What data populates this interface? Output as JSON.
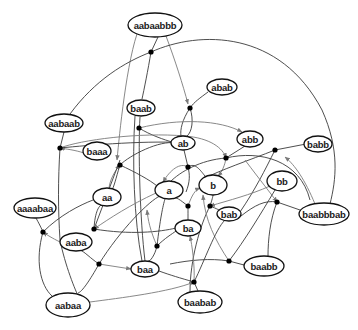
{
  "diagram": {
    "type": "hypergraph",
    "nodes": [
      {
        "id": "aabaabbb",
        "label": "aabaabbb",
        "cx": 155,
        "cy": 25,
        "rx": 27,
        "ry": 12
      },
      {
        "id": "abab",
        "label": "abab",
        "cx": 222,
        "cy": 87,
        "rx": 15,
        "ry": 8
      },
      {
        "id": "baab",
        "label": "baab",
        "cx": 141,
        "cy": 108,
        "rx": 14,
        "ry": 8
      },
      {
        "id": "aabaab",
        "label": "aabaab",
        "cx": 64,
        "cy": 123,
        "rx": 19,
        "ry": 9
      },
      {
        "id": "ab",
        "label": "ab",
        "cx": 183,
        "cy": 143,
        "rx": 12,
        "ry": 7
      },
      {
        "id": "abb",
        "label": "abb",
        "cx": 250,
        "cy": 139,
        "rx": 13,
        "ry": 8
      },
      {
        "id": "babb",
        "label": "babb",
        "cx": 318,
        "cy": 144,
        "rx": 14,
        "ry": 8
      },
      {
        "id": "baaa",
        "label": "baaa",
        "cx": 97,
        "cy": 151,
        "rx": 14,
        "ry": 9
      },
      {
        "id": "a",
        "label": "a",
        "cx": 169,
        "cy": 190,
        "rx": 14,
        "ry": 9
      },
      {
        "id": "b",
        "label": "b",
        "cx": 213,
        "cy": 185,
        "rx": 14,
        "ry": 10
      },
      {
        "id": "bb",
        "label": "bb",
        "cx": 282,
        "cy": 181,
        "rx": 15,
        "ry": 10
      },
      {
        "id": "aa",
        "label": "aa",
        "cx": 107,
        "cy": 197,
        "rx": 14,
        "ry": 9
      },
      {
        "id": "aaaabaa",
        "label": "aaaabaa",
        "cx": 35,
        "cy": 208,
        "rx": 21,
        "ry": 10
      },
      {
        "id": "ba",
        "label": "ba",
        "cx": 188,
        "cy": 228,
        "rx": 13,
        "ry": 8
      },
      {
        "id": "bab",
        "label": "bab",
        "cx": 229,
        "cy": 214,
        "rx": 12,
        "ry": 7
      },
      {
        "id": "baabbbab",
        "label": "baabbbab",
        "cx": 324,
        "cy": 214,
        "rx": 25,
        "ry": 11
      },
      {
        "id": "aaba",
        "label": "aaba",
        "cx": 76,
        "cy": 242,
        "rx": 16,
        "ry": 9
      },
      {
        "id": "baa",
        "label": "baa",
        "cx": 145,
        "cy": 269,
        "rx": 14,
        "ry": 8
      },
      {
        "id": "baabb",
        "label": "baabb",
        "cx": 264,
        "cy": 266,
        "rx": 20,
        "ry": 10
      },
      {
        "id": "aabaa",
        "label": "aabaa",
        "cx": 68,
        "cy": 305,
        "rx": 22,
        "ry": 12
      },
      {
        "id": "baabab",
        "label": "baabab",
        "cx": 200,
        "cy": 302,
        "rx": 22,
        "ry": 11
      }
    ],
    "junctions": [
      {
        "id": "j1",
        "x": 151,
        "y": 52
      },
      {
        "id": "j2",
        "x": 190,
        "y": 108
      },
      {
        "id": "j3",
        "x": 139,
        "y": 128
      },
      {
        "id": "j4",
        "x": 60,
        "y": 148
      },
      {
        "id": "j5",
        "x": 120,
        "y": 165
      },
      {
        "id": "j6",
        "x": 226,
        "y": 158
      },
      {
        "id": "j7",
        "x": 275,
        "y": 150
      },
      {
        "id": "j8",
        "x": 188,
        "y": 167
      },
      {
        "id": "j9",
        "x": 94,
        "y": 229
      },
      {
        "id": "j10",
        "x": 43,
        "y": 232
      },
      {
        "id": "j11",
        "x": 188,
        "y": 206
      },
      {
        "id": "j12",
        "x": 210,
        "y": 206
      },
      {
        "id": "j13",
        "x": 277,
        "y": 202
      },
      {
        "id": "j14",
        "x": 99,
        "y": 264
      },
      {
        "id": "j15",
        "x": 157,
        "y": 246
      },
      {
        "id": "j16",
        "x": 229,
        "y": 261
      },
      {
        "id": "j17",
        "x": 194,
        "y": 282
      }
    ],
    "edges": [
      {
        "d": "M137,34 C125,70 118,150 117,160",
        "arrow": true
      },
      {
        "d": "M158,37 L151,52 C148,70 144,90 142,99",
        "arrow": false
      },
      {
        "d": "M166,36 C175,60 183,85 188,104",
        "arrow": true
      },
      {
        "d": "M70,114 C95,80 125,62 151,52 C200,30 280,30 322,110 C340,150 336,180 330,204",
        "arrow": false
      },
      {
        "d": "M208,92 C200,98 194,102 190,108",
        "arrow": false
      },
      {
        "d": "M190,108 C182,120 180,130 181,136",
        "arrow": false
      },
      {
        "d": "M190,108 C194,120 192,132 187,136",
        "arrow": false
      },
      {
        "d": "M139,128 C150,135 165,140 172,142",
        "arrow": false
      },
      {
        "d": "M139,128 C180,118 220,120 242,132",
        "arrow": true
      },
      {
        "d": "M140,117 C138,150 140,220 145,261",
        "arrow": false
      },
      {
        "d": "M135,116 C132,160 134,220 142,261",
        "arrow": false
      },
      {
        "d": "M60,148 C80,140 140,132 185,136 C210,138 223,148 226,158",
        "arrow": true
      },
      {
        "d": "M84,153 C75,150 66,149 60,148",
        "arrow": true
      },
      {
        "d": "M64,132 L60,148 C58,180 58,210 60,240 C65,265 75,290 80,300",
        "arrow": false
      },
      {
        "d": "M60,148 C90,145 150,140 190,143",
        "arrow": false
      },
      {
        "d": "M120,165 C135,172 150,180 157,186",
        "arrow": false
      },
      {
        "d": "M109,188 C110,180 114,172 120,165",
        "arrow": true
      },
      {
        "d": "M120,165 C130,155 160,140 175,143",
        "arrow": false
      },
      {
        "d": "M226,158 L245,146",
        "arrow": false
      },
      {
        "d": "M226,158 C225,165 222,172 218,176",
        "arrow": true
      },
      {
        "d": "M226,158 C260,150 300,160 310,200",
        "arrow": false
      },
      {
        "d": "M226,158 C200,160 180,172 170,182",
        "arrow": false
      },
      {
        "d": "M275,150 L306,144",
        "arrow": false
      },
      {
        "d": "M275,150 C265,170 255,190 240,212",
        "arrow": false
      },
      {
        "d": "M275,150 C250,160 220,170 201,180",
        "arrow": false
      },
      {
        "d": "M315,204 C305,180 295,165 285,157",
        "arrow": true
      },
      {
        "d": "M188,167 C190,175 190,182 186,192",
        "arrow": false
      },
      {
        "d": "M188,167 C180,162 170,170 163,182",
        "arrow": true
      },
      {
        "d": "M188,167 C195,162 200,170 205,176",
        "arrow": false
      },
      {
        "d": "M184,150 L188,167",
        "arrow": false
      },
      {
        "d": "M120,165 C115,180 112,200 107,188",
        "arrow": false
      },
      {
        "d": "M120,160 L94,229",
        "arrow": false
      },
      {
        "d": "M156,193 C130,205 110,218 94,229",
        "arrow": true
      },
      {
        "d": "M94,229 C95,210 100,203 104,205",
        "arrow": false
      },
      {
        "d": "M94,229 C130,235 160,232 176,228",
        "arrow": false
      },
      {
        "d": "M43,232 C60,215 80,205 93,200",
        "arrow": false
      },
      {
        "d": "M43,232 C40,225 37,220 36,218",
        "arrow": false
      },
      {
        "d": "M60,242 C52,238 47,235 43,232",
        "arrow": true
      },
      {
        "d": "M43,232 C35,260 40,285 52,296",
        "arrow": false
      },
      {
        "d": "M188,206 C188,212 188,216 188,220",
        "arrow": false
      },
      {
        "d": "M188,206 C180,200 176,196 173,199",
        "arrow": false
      },
      {
        "d": "M188,206 C192,195 195,190 200,188",
        "arrow": true
      },
      {
        "d": "M210,206 C220,210 224,212 217,214",
        "arrow": false
      },
      {
        "d": "M270,186 C250,195 230,200 210,206",
        "arrow": true
      },
      {
        "d": "M210,206 C212,200 213,196 213,195",
        "arrow": false
      },
      {
        "d": "M210,206 C200,225 190,260 190,292",
        "arrow": false
      },
      {
        "d": "M241,216 C255,205 265,200 277,202",
        "arrow": false
      },
      {
        "d": "M277,202 L300,210",
        "arrow": false
      },
      {
        "d": "M277,202 C270,220 268,240 268,256",
        "arrow": false
      },
      {
        "d": "M245,160 C260,180 272,195 277,202",
        "arrow": true
      },
      {
        "d": "M99,264 L131,269",
        "arrow": true
      },
      {
        "d": "M99,264 C90,258 85,252 80,250",
        "arrow": false
      },
      {
        "d": "M99,264 C120,230 150,200 160,196",
        "arrow": false
      },
      {
        "d": "M99,264 C90,280 82,292 78,293",
        "arrow": false
      },
      {
        "d": "M157,246 C155,255 150,262 148,261",
        "arrow": false
      },
      {
        "d": "M157,246 C165,238 172,234 176,231",
        "arrow": false
      },
      {
        "d": "M157,246 C150,230 148,220 147,210",
        "arrow": true
      },
      {
        "d": "M157,246 C160,220 163,205 165,199",
        "arrow": false
      },
      {
        "d": "M229,261 L244,265",
        "arrow": false
      },
      {
        "d": "M229,261 C210,258 190,260 170,264",
        "arrow": false
      },
      {
        "d": "M229,261 C215,240 205,220 203,195",
        "arrow": true
      },
      {
        "d": "M229,261 C245,240 260,215 275,190",
        "arrow": false
      },
      {
        "d": "M194,282 L198,291",
        "arrow": false
      },
      {
        "d": "M194,282 C195,265 192,245 190,236",
        "arrow": true
      },
      {
        "d": "M194,282 C205,260 215,230 225,220",
        "arrow": false
      },
      {
        "d": "M159,271 C170,275 180,278 194,282",
        "arrow": false
      },
      {
        "d": "M90,302 C120,298 170,292 194,282",
        "arrow": true
      }
    ]
  }
}
